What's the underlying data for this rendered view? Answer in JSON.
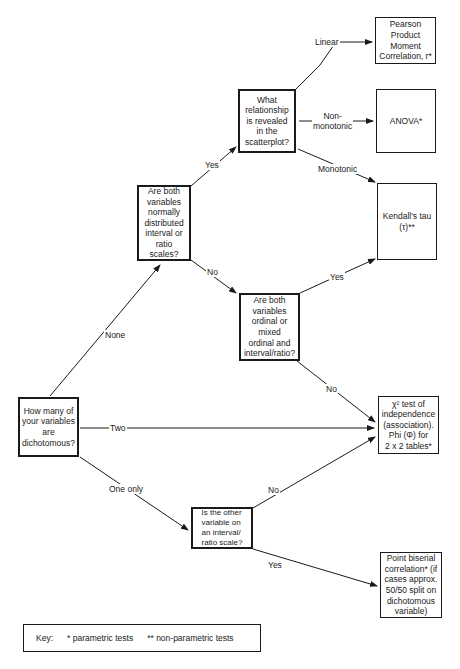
{
  "nodes": {
    "how_many": "How many of\nyour variables\nare\ndichotomous?",
    "normal_interval": "Are both\nvariables\nnormally\ndistributed\ninterval or\nratio\nscales?",
    "relationship": "What\nrelationship\nis revealed\nin the\nscatterplot?",
    "ordinal": "Are both\nvariables\nordinal or\nmixed\nordinal and\ninterval/ratio?",
    "other_interval": "Is the other\nvariable on\nan interval/\nratio scale?",
    "pearson": "Pearson\nProduct\nMoment\nCorrelation, r*",
    "anova": "ANOVA*",
    "kendall": "Kendall's tau\n(τ)**",
    "chi_square": "χ² test of\nindependence\n(association).\nPhi (Φ) for\n2 x 2 tables*",
    "point_biserial": "Point biserial\ncorrelation* (if\ncases approx.\n50/50 split on\ndichotomous\nvariable)"
  },
  "edge_labels": {
    "none": "None",
    "two": "Two",
    "one_only": "One only",
    "yes_normal": "Yes",
    "no_normal": "No",
    "linear": "Linear",
    "non_monotonic": "Non-\nmonotonic",
    "monotonic": "Monotonic",
    "yes_ordinal": "Yes",
    "no_ordinal": "No",
    "no_other": "No",
    "yes_other": "Yes"
  },
  "key": {
    "title": "Key:",
    "single": "* parametric tests",
    "double": "** non-parametric tests"
  }
}
